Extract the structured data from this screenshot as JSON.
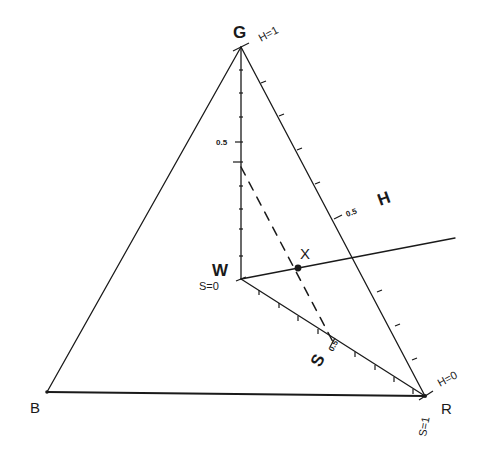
{
  "figure": {
    "type": "hsv-color-triangle-diagram",
    "vertices": {
      "G": "G",
      "B": "B",
      "R": "R",
      "W": "W"
    },
    "labels": {
      "h_axis": "H",
      "s_axis": "S",
      "s_axis_tick": "0.5",
      "h_equals_1": "H=1",
      "h_equals_0": "H=0",
      "s_equals_0": "S=0",
      "s_equals_1": "S=1",
      "h_half": "0.5",
      "v_half": "0.5",
      "point": "X"
    },
    "colors": {
      "line": "#1a1a1a",
      "background": "#ffffff"
    }
  }
}
